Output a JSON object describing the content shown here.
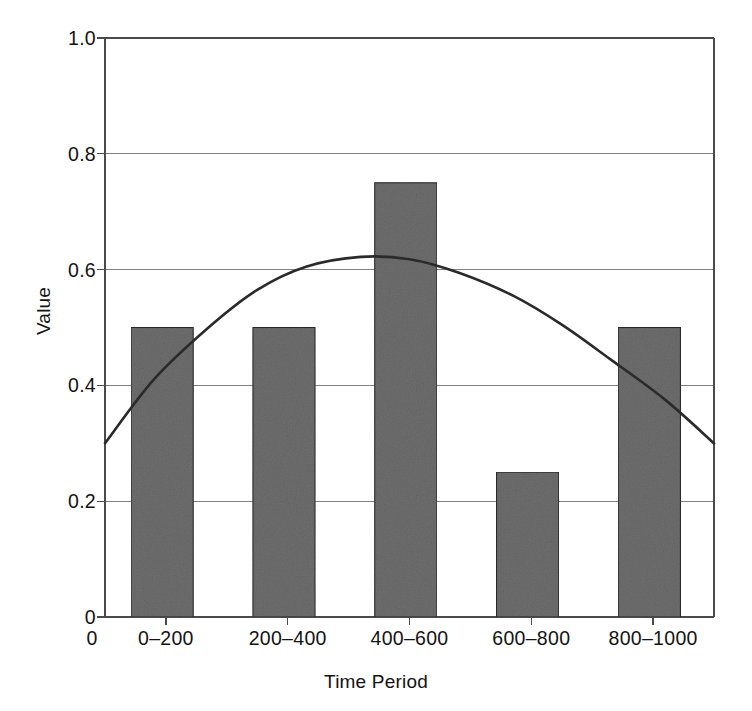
{
  "chart_data": {
    "type": "bar",
    "title": "",
    "subtitle": "",
    "xlabel": "Time Period",
    "ylabel": "Value",
    "categories": [
      "0–200",
      "200–400",
      "400–600",
      "600–800",
      "800–1000"
    ],
    "values": [
      0.5,
      0.5,
      0.75,
      0.25,
      0.5
    ],
    "bar_color": "#6e6e6e",
    "bar_edge_color": "#2b2b2b",
    "ylim": [
      0,
      1.0
    ],
    "y_ticks": [
      "1.0",
      "0.8",
      "0.6",
      "0.4",
      "0.2",
      "0"
    ],
    "y_tick_values": [
      1.0,
      0.8,
      0.6,
      0.4,
      0.2,
      0.0
    ],
    "x_origin_label": "0",
    "grid": true,
    "grid_color": "#808080",
    "axis_color": "#4a4a4a",
    "legend": "none",
    "series": [
      {
        "name": "bars",
        "type": "bar",
        "categories": [
          "0–200",
          "200–400",
          "400–600",
          "600–800",
          "800–1000"
        ],
        "values": [
          0.5,
          0.5,
          0.75,
          0.25,
          0.5
        ]
      },
      {
        "name": "trend-curve",
        "type": "line",
        "color": "#2b2b2b",
        "x": [
          0.0,
          0.08,
          0.17,
          0.25,
          0.33,
          0.42,
          0.5,
          0.58,
          0.67,
          0.75,
          0.83,
          0.92,
          1.0
        ],
        "y": [
          0.3,
          0.41,
          0.5,
          0.565,
          0.605,
          0.622,
          0.618,
          0.595,
          0.555,
          0.505,
          0.445,
          0.375,
          0.3
        ],
        "annotation": "smooth curve rising from 0.30 at left, peaking near 0.62 around the 200–400 period, then falling to about 0.17 at the right edge"
      }
    ]
  },
  "axes": {
    "y_title": "Value",
    "x_title": "Time Period"
  }
}
